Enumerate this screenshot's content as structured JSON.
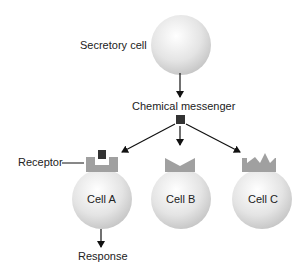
{
  "labels": {
    "secretory_cell": "Secretory cell",
    "chemical_messenger": "Chemical messenger",
    "receptor": "Receptor",
    "cell_a": "Cell A",
    "cell_b": "Cell B",
    "cell_c": "Cell C",
    "response": "Response"
  },
  "colors": {
    "cell_fill": "#e6e6e6",
    "receptor_fill": "#a0a0a0",
    "messenger_fill": "#333333",
    "arrow": "#111111"
  }
}
